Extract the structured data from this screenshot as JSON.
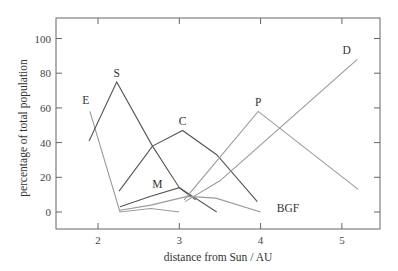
{
  "chart_data": {
    "type": "line",
    "title": "",
    "xlabel": "distance from Sun / AU",
    "ylabel": "percentage of total population",
    "xlim": [
      1.48,
      5.47
    ],
    "ylim": [
      -10,
      110
    ],
    "xticks": [
      2,
      3,
      4,
      5
    ],
    "yticks": [
      0,
      20,
      40,
      60,
      80,
      100
    ],
    "grid": false,
    "legend": "inline labels",
    "series": [
      {
        "name": "E",
        "color": "#9a9a9a",
        "label_at": [
          1.85,
          62
        ],
        "x": [
          1.9,
          2.27,
          2.65,
          3.0
        ],
        "y": [
          58,
          0,
          2,
          0
        ]
      },
      {
        "name": "S",
        "color": "#555555",
        "label_at": [
          2.23,
          78
        ],
        "x": [
          1.89,
          2.23,
          2.67,
          3.0,
          3.46
        ],
        "y": [
          41,
          75,
          38,
          14,
          0
        ]
      },
      {
        "name": "C",
        "color": "#555555",
        "label_at": [
          3.04,
          50
        ],
        "x": [
          2.26,
          2.67,
          3.04,
          3.46,
          3.96
        ],
        "y": [
          12,
          38,
          47,
          33,
          6
        ]
      },
      {
        "name": "M",
        "color": "#555555",
        "label_at": [
          2.73,
          14
        ],
        "x": [
          2.27,
          2.64,
          3.0,
          3.2
        ],
        "y": [
          3,
          9,
          14,
          7
        ]
      },
      {
        "name": "BGF",
        "color": "#9a9a9a",
        "label_at": [
          4.2,
          0
        ],
        "x": [
          2.27,
          2.65,
          3.1,
          3.45,
          4.0
        ],
        "y": [
          1,
          4,
          9,
          8,
          0
        ]
      },
      {
        "name": "P",
        "color": "#9a9a9a",
        "label_at": [
          3.97,
          61
        ],
        "x": [
          3.06,
          3.97,
          5.2
        ],
        "y": [
          7,
          58,
          13
        ]
      },
      {
        "name": "D",
        "color": "#9a9a9a",
        "label_at": [
          5.06,
          91
        ],
        "x": [
          3.07,
          3.5,
          3.96,
          5.19
        ],
        "y": [
          6,
          18,
          37,
          88
        ]
      }
    ]
  },
  "axes": {
    "xlabel": "distance from Sun / AU",
    "ylabel": "percentage of total population",
    "xtick_labels": [
      "2",
      "3",
      "4",
      "5"
    ],
    "ytick_labels": [
      "0",
      "20",
      "40",
      "60",
      "80",
      "100"
    ]
  },
  "labels": {
    "E": "E",
    "S": "S",
    "C": "C",
    "M": "M",
    "BGF": "BGF",
    "P": "P",
    "D": "D"
  }
}
